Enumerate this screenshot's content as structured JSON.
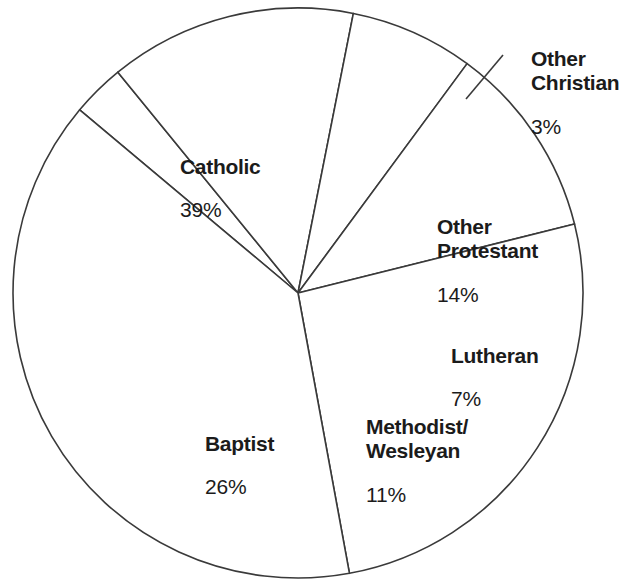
{
  "chart_data": {
    "type": "pie",
    "title": "",
    "subtitle": "",
    "xlabel": "",
    "ylabel": "",
    "legend_position": "none",
    "grid": false,
    "units": "percent",
    "value_suffix": "%",
    "total": 100,
    "start_angle_deg": -50,
    "direction": "clockwise",
    "geometry": {
      "center_x": 298,
      "center_y": 293,
      "radius": 285
    },
    "style": {
      "slice_fill": "#ffffff",
      "slice_stroke": "#3a3a3a",
      "text_color": "#1b1b1b",
      "background": "#ffffff"
    },
    "categories": [
      "Other Christian",
      "Other Protestant",
      "Lutheran",
      "Methodist/\nWesleyan",
      "Baptist",
      "Catholic"
    ],
    "values": [
      3,
      14,
      7,
      11,
      26,
      39
    ],
    "slices": [
      {
        "id": "other-christian",
        "name": "Other Christian",
        "value": 3,
        "value_label": "3%",
        "start_deg": -50,
        "end_deg": -39.2,
        "leader": true
      },
      {
        "id": "other-protestant",
        "name": "Other\nProtestant",
        "value": 14,
        "value_label": "14%",
        "start_deg": -39.2,
        "end_deg": 11.2,
        "leader": false
      },
      {
        "id": "lutheran",
        "name": "Lutheran",
        "value": 7,
        "value_label": "7%",
        "start_deg": 11.2,
        "end_deg": 36.4,
        "leader": false
      },
      {
        "id": "methodist-wesleyan",
        "name": "Methodist/\nWesleyan",
        "value": 11,
        "value_label": "11%",
        "start_deg": 36.4,
        "end_deg": 76.0,
        "leader": false
      },
      {
        "id": "baptist",
        "name": "Baptist",
        "value": 26,
        "value_label": "26%",
        "start_deg": 76.0,
        "end_deg": 169.6,
        "leader": false
      },
      {
        "id": "catholic",
        "name": "Catholic",
        "value": 39,
        "value_label": "39%",
        "start_deg": 169.6,
        "end_deg": 310.0,
        "leader": false
      }
    ]
  },
  "labels": {
    "catholic": {
      "name": "Catholic",
      "value": "39%"
    },
    "other_christian": {
      "name": "Other Christian",
      "value": "3%"
    },
    "other_protestant": {
      "name": "Other\nProtestant",
      "value": "14%"
    },
    "lutheran": {
      "name": "Lutheran",
      "value": "7%"
    },
    "methodist": {
      "name": "Methodist/\nWesleyan",
      "value": "11%"
    },
    "baptist": {
      "name": "Baptist",
      "value": "26%"
    }
  }
}
